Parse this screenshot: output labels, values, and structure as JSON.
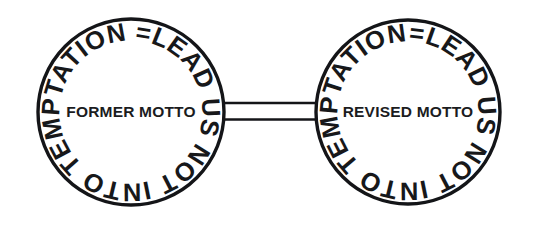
{
  "figure": {
    "title": "Two linked circular seals comparing a former motto and a revised motto",
    "background_color": "#ffffff",
    "ink_color": "#141518",
    "connector": {
      "name": "double-line-bar",
      "style": "two parallel horizontal lines"
    },
    "seals": [
      {
        "id": "former",
        "ring_text": "=LEAD US NOT INTO TEMPTATION",
        "center_label": "FORMER MOTTO",
        "cx": 131,
        "cy": 112,
        "r": 93
      },
      {
        "id": "revised",
        "ring_text": "=LEAD US NOT INTO TEMPTATION",
        "center_label": "REVISED MOTTO",
        "cx": 408,
        "cy": 112,
        "r": 92
      }
    ]
  }
}
